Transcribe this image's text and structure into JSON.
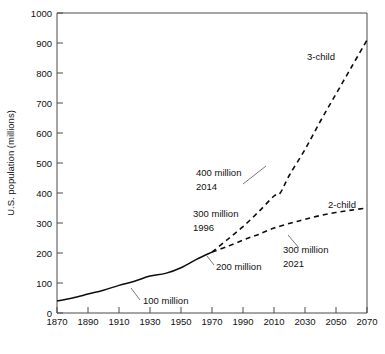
{
  "chart_data": {
    "type": "line",
    "title": "",
    "xlabel": "",
    "ylabel": "U.S. population (millions)",
    "xlim": [
      1870,
      2070
    ],
    "ylim": [
      0,
      1000
    ],
    "grid": false,
    "legend_position": "inline-labels",
    "xticks": [
      1870,
      1890,
      1910,
      1930,
      1950,
      1970,
      1990,
      2010,
      2030,
      2050,
      2070
    ],
    "yticks": [
      0,
      100,
      200,
      300,
      400,
      500,
      600,
      700,
      800,
      900,
      1000
    ],
    "series": [
      {
        "name": "historical",
        "style": "solid",
        "x": [
          1870,
          1880,
          1890,
          1900,
          1910,
          1920,
          1930,
          1940,
          1950,
          1960,
          1970
        ],
        "values": [
          40,
          50,
          63,
          76,
          92,
          106,
          123,
          132,
          151,
          179,
          203
        ]
      },
      {
        "name": "3-child",
        "style": "dashed",
        "x": [
          1970,
          1980,
          1990,
          2000,
          2010,
          2014,
          2020,
          2030,
          2040,
          2050,
          2060,
          2070
        ],
        "values": [
          203,
          245,
          288,
          337,
          390,
          400,
          460,
          545,
          640,
          730,
          820,
          910
        ]
      },
      {
        "name": "2-child",
        "style": "dashed",
        "x": [
          1970,
          1980,
          1990,
          1996,
          2000,
          2010,
          2021,
          2030,
          2040,
          2050,
          2060,
          2070
        ],
        "values": [
          203,
          222,
          243,
          255,
          262,
          283,
          300,
          312,
          325,
          335,
          343,
          350
        ]
      }
    ],
    "annotations": [
      {
        "label": "3-child",
        "kind": "series-label",
        "x": 2032,
        "y": 855
      },
      {
        "label": "2-child",
        "kind": "series-label",
        "x": 2043,
        "y": 400
      },
      {
        "label": "100 million",
        "line1": "100 million",
        "line2": "",
        "kind": "callout",
        "x": 1912,
        "y": 92
      },
      {
        "label": "200 million",
        "line1": "200 million",
        "line2": "",
        "kind": "callout",
        "x": 1970,
        "y": 203
      },
      {
        "label": "300 million 1996",
        "line1": "300 million",
        "line2": "1996",
        "kind": "callout",
        "x": 1996,
        "y": 255
      },
      {
        "label": "400 million 2014",
        "line1": "400 million",
        "line2": "2014",
        "kind": "callout",
        "x": 2014,
        "y": 400
      },
      {
        "label": "300 million 2021",
        "line1": "300 million",
        "line2": "2021",
        "kind": "callout",
        "x": 2021,
        "y": 300
      }
    ]
  },
  "axis": {
    "y_title": "U.S. population (millions)",
    "y_ticks": [
      "1000",
      "900",
      "800",
      "700",
      "600",
      "500",
      "400",
      "300",
      "200",
      "100",
      "0"
    ],
    "x_ticks": [
      "1870",
      "1890",
      "1910",
      "1930",
      "1950",
      "1970",
      "1990",
      "2010",
      "2030",
      "2050",
      "2070"
    ]
  },
  "labels": {
    "three_child": "3-child",
    "two_child": "2-child",
    "hundred_million": "100 million",
    "two_hundred_million": "200 million",
    "three_hundred_million_1996_l1": "300 million",
    "three_hundred_million_1996_l2": "1996",
    "four_hundred_million_2014_l1": "400 million",
    "four_hundred_million_2014_l2": "2014",
    "three_hundred_million_2021_l1": "300 million",
    "three_hundred_million_2021_l2": "2021"
  },
  "colors": {
    "series": "#0d0d0d",
    "frame": "#4a4a4a",
    "text": "#111111",
    "background": "#ffffff"
  }
}
